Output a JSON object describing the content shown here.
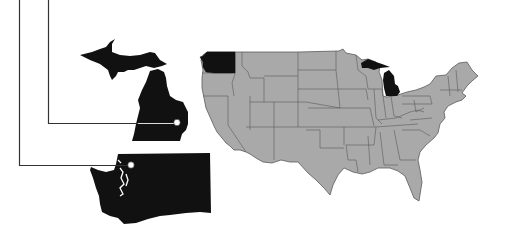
{
  "figure": {
    "description": "Map of the contiguous United States with Washington and Michigan highlighted in black, each enlarged and connected by callout lines",
    "colors": {
      "background": "#ffffff",
      "other_states": "#a9a9a9",
      "state_borders": "#5a5a5a",
      "highlighted_states": "#111111",
      "callout_lines": "#333333",
      "marker_dots": "#ffffff"
    },
    "highlighted_states": [
      {
        "name": "Washington",
        "role": "enlarged-inset"
      },
      {
        "name": "Michigan",
        "role": "enlarged-inset"
      }
    ],
    "callouts": [
      {
        "target": "Washington",
        "marker": "Seattle-area point"
      },
      {
        "target": "Michigan",
        "marker": "southeast Michigan point"
      }
    ]
  }
}
